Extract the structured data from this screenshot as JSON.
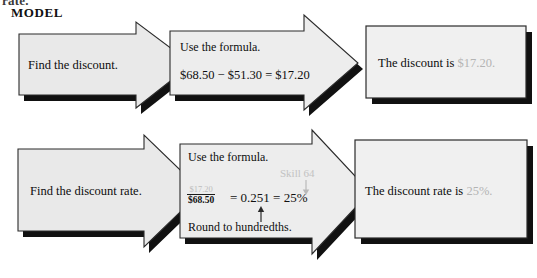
{
  "page": {
    "cutoff_top_text": "rate.",
    "model_label": "MODEL",
    "width": 537,
    "height": 278,
    "background": "#ffffff"
  },
  "colors": {
    "box_fill": "#e9e9e9",
    "box_fill_light": "#f0f0f0",
    "outline": "#2b2b2b",
    "shadow": "#111111",
    "text": "#0d0d0d",
    "highlight_gray": "#b4b4b4",
    "skill_note_gray": "#c2c2c2"
  },
  "flow": {
    "rows": [
      {
        "id": "row-discount",
        "steps": [
          {
            "id": "step-find-discount",
            "shape": "arrow",
            "lines": [
              {
                "text": "Find the discount.",
                "style": "normal"
              }
            ]
          },
          {
            "id": "step-formula-discount",
            "shape": "arrow",
            "lines": [
              {
                "text": "Use the formula.",
                "style": "normal"
              },
              {
                "text": "$68.50 − $51.30 = $17.20",
                "style": "normal"
              }
            ]
          },
          {
            "id": "step-result-discount",
            "shape": "rectangle",
            "result_prefix": "The discount is ",
            "result_value": "$17.20."
          }
        ]
      },
      {
        "id": "row-discount-rate",
        "steps": [
          {
            "id": "step-find-discount-rate",
            "shape": "arrow",
            "lines": [
              {
                "text": "Find the discount  rate.",
                "style": "normal"
              }
            ]
          },
          {
            "id": "step-formula-discount-rate",
            "shape": "arrow",
            "heading": "Use the formula.",
            "fraction": {
              "numerator": "$17.20",
              "denominator": "$68.50"
            },
            "equation_tail": "= 0.251 = 25%",
            "skill_note": "Skill 64",
            "footnote": "Round to hundredths."
          },
          {
            "id": "step-result-discount-rate",
            "shape": "rectangle",
            "result_prefix": "The discount rate is ",
            "result_value": "25%."
          }
        ]
      }
    ]
  }
}
